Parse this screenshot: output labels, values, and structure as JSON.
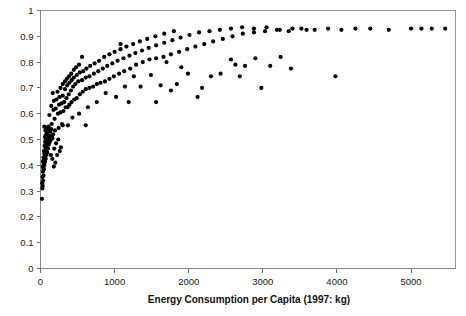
{
  "chart_data": {
    "type": "scatter",
    "title": "",
    "xlabel": "Energy Consumption per Capita (1997: kg)",
    "ylabel": "",
    "xlim": [
      0,
      5600
    ],
    "ylim": [
      0,
      1
    ],
    "grid": false,
    "legend": null,
    "x_ticks": [
      0,
      1000,
      2000,
      3000,
      4000,
      5000
    ],
    "x_tick_labels": [
      "0",
      "1000",
      "2000",
      "3000",
      "4000",
      "5000"
    ],
    "y_ticks": [
      0,
      0.1,
      0.2,
      0.3,
      0.4,
      0.5,
      0.6,
      0.7,
      0.8,
      0.9,
      1
    ],
    "y_tick_labels": [
      "0",
      "0.1",
      "0.2",
      "0.3",
      "0.4",
      "0.5",
      "0.6",
      "0.7",
      "0.8",
      "0.9",
      "1"
    ],
    "marker_color": "#000000",
    "marker_size": 2.1,
    "points": [
      [
        20,
        0.27
      ],
      [
        25,
        0.31
      ],
      [
        30,
        0.32
      ],
      [
        22,
        0.33
      ],
      [
        35,
        0.34
      ],
      [
        28,
        0.355
      ],
      [
        40,
        0.36
      ],
      [
        32,
        0.375
      ],
      [
        45,
        0.385
      ],
      [
        38,
        0.39
      ],
      [
        30,
        0.395
      ],
      [
        50,
        0.4
      ],
      [
        42,
        0.405
      ],
      [
        55,
        0.41
      ],
      [
        35,
        0.415
      ],
      [
        60,
        0.415
      ],
      [
        48,
        0.42
      ],
      [
        70,
        0.425
      ],
      [
        40,
        0.43
      ],
      [
        58,
        0.435
      ],
      [
        80,
        0.44
      ],
      [
        52,
        0.445
      ],
      [
        90,
        0.45
      ],
      [
        45,
        0.455
      ],
      [
        65,
        0.46
      ],
      [
        100,
        0.465
      ],
      [
        75,
        0.47
      ],
      [
        55,
        0.475
      ],
      [
        110,
        0.48
      ],
      [
        85,
        0.485
      ],
      [
        62,
        0.49
      ],
      [
        125,
        0.49
      ],
      [
        95,
        0.495
      ],
      [
        70,
        0.5
      ],
      [
        140,
        0.5
      ],
      [
        105,
        0.505
      ],
      [
        60,
        0.51
      ],
      [
        155,
        0.51
      ],
      [
        115,
        0.515
      ],
      [
        78,
        0.52
      ],
      [
        170,
        0.52
      ],
      [
        88,
        0.525
      ],
      [
        130,
        0.53
      ],
      [
        66,
        0.535
      ],
      [
        195,
        0.535
      ],
      [
        98,
        0.54
      ],
      [
        145,
        0.54
      ],
      [
        72,
        0.545
      ],
      [
        52,
        0.55
      ],
      [
        108,
        0.55
      ],
      [
        225,
        0.44
      ],
      [
        260,
        0.455
      ],
      [
        185,
        0.465
      ],
      [
        210,
        0.485
      ],
      [
        240,
        0.5
      ],
      [
        160,
        0.505
      ],
      [
        275,
        0.47
      ],
      [
        300,
        0.555
      ],
      [
        150,
        0.56
      ],
      [
        190,
        0.58
      ],
      [
        120,
        0.595
      ],
      [
        235,
        0.6
      ],
      [
        270,
        0.605
      ],
      [
        310,
        0.61
      ],
      [
        175,
        0.615
      ],
      [
        205,
        0.62
      ],
      [
        340,
        0.625
      ],
      [
        145,
        0.63
      ],
      [
        365,
        0.625
      ],
      [
        250,
        0.635
      ],
      [
        285,
        0.64
      ],
      [
        390,
        0.635
      ],
      [
        320,
        0.645
      ],
      [
        420,
        0.645
      ],
      [
        180,
        0.65
      ],
      [
        215,
        0.655
      ],
      [
        455,
        0.655
      ],
      [
        350,
        0.66
      ],
      [
        255,
        0.665
      ],
      [
        490,
        0.66
      ],
      [
        300,
        0.67
      ],
      [
        380,
        0.675
      ],
      [
        165,
        0.68
      ],
      [
        530,
        0.675
      ],
      [
        230,
        0.685
      ],
      [
        410,
        0.69
      ],
      [
        570,
        0.685
      ],
      [
        330,
        0.695
      ],
      [
        610,
        0.695
      ],
      [
        270,
        0.7
      ],
      [
        440,
        0.705
      ],
      [
        660,
        0.7
      ],
      [
        360,
        0.71
      ],
      [
        300,
        0.715
      ],
      [
        710,
        0.705
      ],
      [
        470,
        0.715
      ],
      [
        390,
        0.72
      ],
      [
        760,
        0.715
      ],
      [
        330,
        0.725
      ],
      [
        510,
        0.725
      ],
      [
        810,
        0.72
      ],
      [
        420,
        0.73
      ],
      [
        355,
        0.735
      ],
      [
        560,
        0.73
      ],
      [
        870,
        0.725
      ],
      [
        450,
        0.74
      ],
      [
        610,
        0.74
      ],
      [
        930,
        0.735
      ],
      [
        385,
        0.745
      ],
      [
        490,
        0.75
      ],
      [
        660,
        0.745
      ],
      [
        990,
        0.745
      ],
      [
        415,
        0.755
      ],
      [
        530,
        0.76
      ],
      [
        720,
        0.755
      ],
      [
        1060,
        0.755
      ],
      [
        575,
        0.765
      ],
      [
        450,
        0.77
      ],
      [
        780,
        0.765
      ],
      [
        1130,
        0.765
      ],
      [
        620,
        0.775
      ],
      [
        840,
        0.775
      ],
      [
        480,
        0.78
      ],
      [
        1210,
        0.775
      ],
      [
        670,
        0.785
      ],
      [
        900,
        0.785
      ],
      [
        1290,
        0.79
      ],
      [
        730,
        0.795
      ],
      [
        970,
        0.795
      ],
      [
        520,
        0.79
      ],
      [
        1380,
        0.8
      ],
      [
        790,
        0.805
      ],
      [
        1040,
        0.805
      ],
      [
        1470,
        0.81
      ],
      [
        1120,
        0.815
      ],
      [
        560,
        0.82
      ],
      [
        860,
        0.82
      ],
      [
        1560,
        0.815
      ],
      [
        1200,
        0.825
      ],
      [
        930,
        0.83
      ],
      [
        1660,
        0.82
      ],
      [
        1280,
        0.835
      ],
      [
        1000,
        0.84
      ],
      [
        1760,
        0.83
      ],
      [
        1370,
        0.845
      ],
      [
        1080,
        0.85
      ],
      [
        1870,
        0.84
      ],
      [
        1460,
        0.855
      ],
      [
        1160,
        0.86
      ],
      [
        1980,
        0.85
      ],
      [
        1560,
        0.865
      ],
      [
        1250,
        0.87
      ],
      [
        2090,
        0.86
      ],
      [
        1670,
        0.875
      ],
      [
        1340,
        0.88
      ],
      [
        2210,
        0.87
      ],
      [
        1780,
        0.885
      ],
      [
        1440,
        0.89
      ],
      [
        2330,
        0.88
      ],
      [
        1890,
        0.895
      ],
      [
        1550,
        0.9
      ],
      [
        2460,
        0.89
      ],
      [
        2010,
        0.905
      ],
      [
        1670,
        0.91
      ],
      [
        2590,
        0.9
      ],
      [
        2140,
        0.915
      ],
      [
        1800,
        0.92
      ],
      [
        2730,
        0.91
      ],
      [
        2280,
        0.92
      ],
      [
        1080,
        0.87
      ],
      [
        2420,
        0.925
      ],
      [
        2880,
        0.915
      ],
      [
        2570,
        0.93
      ],
      [
        3030,
        0.92
      ],
      [
        2720,
        0.935
      ],
      [
        3190,
        0.925
      ],
      [
        2880,
        0.93
      ],
      [
        3350,
        0.92
      ],
      [
        3050,
        0.935
      ],
      [
        3520,
        0.93
      ],
      [
        3230,
        0.925
      ],
      [
        3700,
        0.925
      ],
      [
        3400,
        0.93
      ],
      [
        3880,
        0.93
      ],
      [
        3590,
        0.925
      ],
      [
        4060,
        0.925
      ],
      [
        4250,
        0.93
      ],
      [
        4450,
        0.93
      ],
      [
        4700,
        0.925
      ],
      [
        5000,
        0.93
      ],
      [
        5140,
        0.93
      ],
      [
        5280,
        0.93
      ],
      [
        5460,
        0.93
      ],
      [
        2690,
        0.745
      ],
      [
        2630,
        0.79
      ],
      [
        2570,
        0.81
      ],
      [
        2760,
        0.785
      ],
      [
        2980,
        0.7
      ],
      [
        3980,
        0.745
      ],
      [
        2180,
        0.7
      ],
      [
        2300,
        0.745
      ],
      [
        2430,
        0.755
      ],
      [
        1990,
        0.755
      ],
      [
        1840,
        0.715
      ],
      [
        1620,
        0.71
      ],
      [
        1490,
        0.75
      ],
      [
        1350,
        0.705
      ],
      [
        1260,
        0.745
      ],
      [
        1140,
        0.705
      ],
      [
        1020,
        0.665
      ],
      [
        880,
        0.68
      ],
      [
        1190,
        0.645
      ],
      [
        1560,
        0.645
      ],
      [
        1760,
        0.69
      ],
      [
        2120,
        0.665
      ],
      [
        3380,
        0.775
      ],
      [
        3240,
        0.82
      ],
      [
        3100,
        0.785
      ],
      [
        2900,
        0.815
      ],
      [
        1900,
        0.78
      ],
      [
        1700,
        0.8
      ],
      [
        760,
        0.645
      ],
      [
        640,
        0.625
      ],
      [
        520,
        0.6
      ],
      [
        430,
        0.585
      ],
      [
        610,
        0.555
      ],
      [
        370,
        0.555
      ],
      [
        245,
        0.545
      ],
      [
        290,
        0.56
      ],
      [
        140,
        0.44
      ],
      [
        160,
        0.425
      ],
      [
        200,
        0.41
      ],
      [
        180,
        0.395
      ]
    ]
  },
  "axes": {
    "x_title": "Energy Consumption per Capita (1997: kg)"
  }
}
